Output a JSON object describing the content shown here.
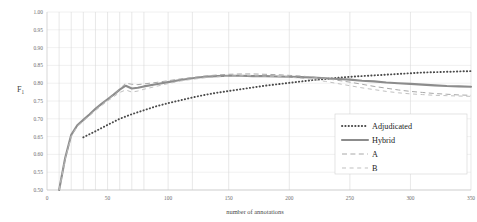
{
  "chart_data": {
    "type": "line",
    "title": "",
    "xlabel": "number of annotations",
    "ylabel": "F1",
    "ylabel_base": "F",
    "ylabel_sub": "1",
    "xlim": [
      0,
      350
    ],
    "ylim": [
      0.5,
      1.0
    ],
    "xticks": [
      0,
      50,
      100,
      150,
      200,
      250,
      300,
      350
    ],
    "xtick_labels": [
      "0",
      "50",
      "100",
      "150",
      "200",
      "250",
      "300",
      "350"
    ],
    "yticks": [
      0.5,
      0.55,
      0.6,
      0.65,
      0.7,
      0.75,
      0.8,
      0.85,
      0.9,
      0.95,
      1.0
    ],
    "ytick_labels": [
      "0.50",
      "0.55",
      "0.60",
      "0.65",
      "0.70",
      "0.75",
      "0.80",
      "0.85",
      "0.90",
      "0.95",
      "1.00"
    ],
    "grid": {
      "vertical": true,
      "horizontal": true
    },
    "legend_position": "lower-right",
    "colors": {
      "adjudicated": "#4a4a4a",
      "hybrid": "#8c8c8c",
      "a": "#a8a8a8",
      "b": "#bdbdbd",
      "grid": "#d9d9d9",
      "axis": "#c6c6c6",
      "text": "#3a3a3a"
    },
    "series": [
      {
        "name": "Adjudicated",
        "style": "dotted",
        "color": "#4a4a4a",
        "x": [
          30,
          40,
          50,
          60,
          70,
          80,
          90,
          100,
          110,
          120,
          130,
          140,
          150,
          160,
          170,
          180,
          190,
          200,
          210,
          220,
          230,
          240,
          250,
          260,
          270,
          280,
          290,
          300,
          310,
          320,
          330,
          340,
          350
        ],
        "values": [
          0.648,
          0.665,
          0.683,
          0.7,
          0.713,
          0.724,
          0.735,
          0.744,
          0.752,
          0.76,
          0.767,
          0.773,
          0.778,
          0.783,
          0.788,
          0.793,
          0.797,
          0.801,
          0.805,
          0.809,
          0.812,
          0.815,
          0.818,
          0.82,
          0.822,
          0.824,
          0.826,
          0.828,
          0.83,
          0.831,
          0.832,
          0.833,
          0.834
        ]
      },
      {
        "name": "Hybrid",
        "style": "solid",
        "color": "#8c8c8c",
        "x": [
          10,
          15,
          20,
          25,
          30,
          35,
          40,
          45,
          50,
          55,
          60,
          65,
          70,
          75,
          80,
          90,
          100,
          110,
          120,
          130,
          140,
          150,
          160,
          170,
          180,
          190,
          200,
          210,
          220,
          230,
          240,
          250,
          260,
          270,
          280,
          290,
          300,
          310,
          320,
          330,
          340,
          350
        ],
        "values": [
          0.5,
          0.59,
          0.655,
          0.682,
          0.697,
          0.712,
          0.728,
          0.742,
          0.755,
          0.768,
          0.782,
          0.793,
          0.785,
          0.787,
          0.791,
          0.797,
          0.803,
          0.809,
          0.814,
          0.818,
          0.82,
          0.821,
          0.821,
          0.82,
          0.82,
          0.819,
          0.818,
          0.817,
          0.816,
          0.814,
          0.812,
          0.81,
          0.807,
          0.805,
          0.802,
          0.8,
          0.798,
          0.796,
          0.794,
          0.792,
          0.791,
          0.79
        ]
      },
      {
        "name": "A",
        "style": "dashed",
        "color": "#a8a8a8",
        "x": [
          10,
          15,
          20,
          25,
          30,
          35,
          40,
          45,
          50,
          55,
          60,
          65,
          70,
          75,
          80,
          90,
          100,
          110,
          120,
          130,
          140,
          150,
          160,
          170,
          180,
          190,
          200,
          210,
          220,
          230,
          240,
          250,
          260,
          270,
          280,
          290,
          300,
          310,
          320,
          330,
          340,
          350
        ],
        "values": [
          0.5,
          0.588,
          0.652,
          0.68,
          0.695,
          0.71,
          0.726,
          0.74,
          0.754,
          0.767,
          0.784,
          0.8,
          0.797,
          0.796,
          0.798,
          0.802,
          0.807,
          0.812,
          0.816,
          0.82,
          0.823,
          0.825,
          0.826,
          0.826,
          0.825,
          0.824,
          0.822,
          0.82,
          0.817,
          0.813,
          0.808,
          0.803,
          0.797,
          0.791,
          0.786,
          0.781,
          0.777,
          0.774,
          0.771,
          0.769,
          0.767,
          0.766
        ]
      },
      {
        "name": "B",
        "style": "dashed-light",
        "color": "#bdbdbd",
        "x": [
          10,
          15,
          20,
          25,
          30,
          35,
          40,
          45,
          50,
          55,
          60,
          65,
          70,
          75,
          80,
          90,
          100,
          110,
          120,
          130,
          140,
          150,
          160,
          170,
          180,
          190,
          200,
          210,
          220,
          230,
          240,
          250,
          260,
          270,
          280,
          290,
          300,
          310,
          320,
          330,
          340,
          350
        ],
        "values": [
          0.5,
          0.586,
          0.65,
          0.678,
          0.693,
          0.708,
          0.723,
          0.737,
          0.75,
          0.762,
          0.774,
          0.781,
          0.775,
          0.778,
          0.783,
          0.791,
          0.799,
          0.806,
          0.811,
          0.815,
          0.818,
          0.82,
          0.821,
          0.821,
          0.82,
          0.819,
          0.817,
          0.814,
          0.81,
          0.805,
          0.799,
          0.793,
          0.787,
          0.782,
          0.777,
          0.773,
          0.77,
          0.768,
          0.766,
          0.765,
          0.764,
          0.763
        ]
      }
    ],
    "legend": [
      {
        "label": "Adjudicated",
        "style": "dotted",
        "color": "#4a4a4a"
      },
      {
        "label": "Hybrid",
        "style": "solid",
        "color": "#8c8c8c"
      },
      {
        "label": "A",
        "style": "dashed",
        "color": "#a8a8a8"
      },
      {
        "label": "B",
        "style": "dashed-light",
        "color": "#bdbdbd"
      }
    ],
    "extra_vertical_gridlines": [
      10,
      20,
      30,
      40,
      50,
      60,
      70,
      80,
      100,
      120,
      150,
      200,
      250,
      300,
      350
    ]
  }
}
